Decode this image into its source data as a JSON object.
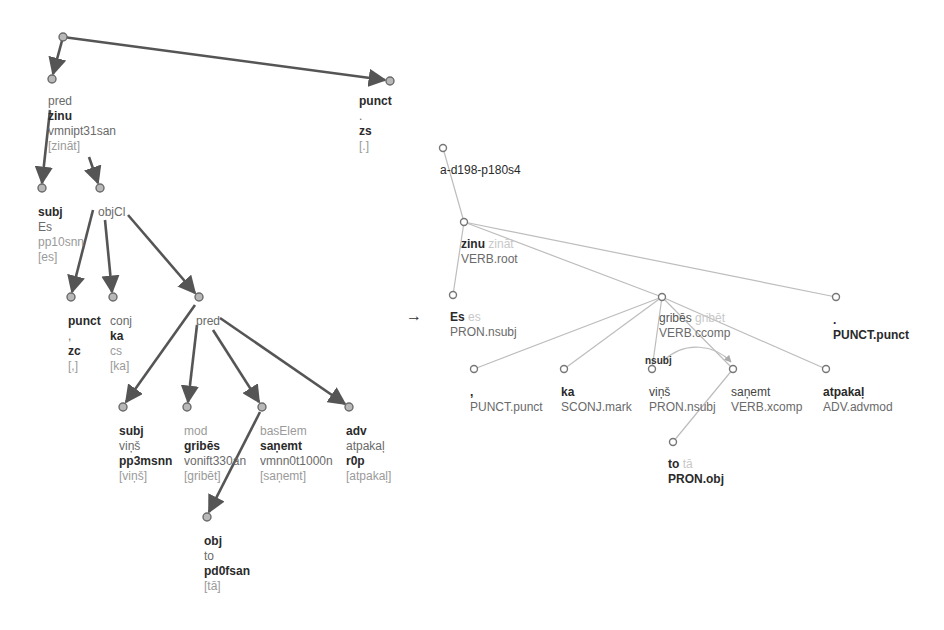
{
  "separator_arrow": "→",
  "left_tree": {
    "nodes": [
      {
        "id": "root",
        "x": 63,
        "y": 37
      },
      {
        "id": "pred",
        "x": 52,
        "y": 79,
        "rel": "pred",
        "form": "zinu",
        "tag": "vmnipt31san",
        "lemma": "[zināt]"
      },
      {
        "id": "punct_top",
        "x": 390,
        "y": 81,
        "rel": "punct",
        "form": ".",
        "tag": "zs",
        "lemma": "[.]"
      },
      {
        "id": "subj_es",
        "x": 42,
        "y": 188,
        "rel": "subj",
        "form": "Es",
        "tag": "pp10snn",
        "lemma": "[es]"
      },
      {
        "id": "objcl",
        "x": 100,
        "y": 188,
        "rel": "objCl"
      },
      {
        "id": "punct_comma",
        "x": 71,
        "y": 297,
        "rel": "punct",
        "form": ",",
        "tag": "zc",
        "lemma": "[,]"
      },
      {
        "id": "conj_ka",
        "x": 113,
        "y": 297,
        "rel": "conj",
        "form": "ka",
        "tag": "cs",
        "lemma": "[ka]"
      },
      {
        "id": "pred2",
        "x": 199,
        "y": 297,
        "rel": "pred"
      },
      {
        "id": "subj_vins",
        "x": 123,
        "y": 407,
        "rel": "subj",
        "form": "viņš",
        "tag": "pp3msnn",
        "lemma": "[viņš]"
      },
      {
        "id": "mod_gribes",
        "x": 187,
        "y": 407,
        "rel": "mod",
        "form": "gribēs",
        "tag": "vonift330an",
        "lemma": "[gribēt]"
      },
      {
        "id": "baselem",
        "x": 262,
        "y": 407,
        "rel": "basElem",
        "form": "saņemt",
        "tag": "vmnn0t1000n",
        "lemma": "[saņemt]"
      },
      {
        "id": "adv",
        "x": 349,
        "y": 407,
        "rel": "adv",
        "form": "atpakaļ",
        "tag": "r0p",
        "lemma": "[atpakaļ]"
      },
      {
        "id": "obj_to",
        "x": 207,
        "y": 517,
        "rel": "obj",
        "form": "to",
        "tag": "pd0fsan",
        "lemma": "[tā]"
      }
    ]
  },
  "right_tree": {
    "sentence_id": "a-d198-p180s4",
    "nodes": [
      {
        "id": "r_root",
        "x": 443,
        "y": 148
      },
      {
        "id": "r_zinu",
        "x": 464,
        "y": 222,
        "form": "zinu",
        "lemma": "zināt",
        "pos_rel": "VERB.root"
      },
      {
        "id": "r_es",
        "x": 453,
        "y": 295,
        "form": "Es",
        "lemma": "es",
        "pos_rel": "PRON.nsubj"
      },
      {
        "id": "r_gribes",
        "x": 662,
        "y": 297,
        "form": "gribēs",
        "lemma": "gribēt",
        "pos_rel": "VERB.ccomp"
      },
      {
        "id": "r_punct",
        "x": 836,
        "y": 297,
        "form": ".",
        "lemma": "",
        "pos_rel": "PUNCT.punct"
      },
      {
        "id": "r_comma",
        "x": 474,
        "y": 369,
        "form": ",",
        "lemma": "",
        "pos_rel": "PUNCT.punct"
      },
      {
        "id": "r_ka",
        "x": 564,
        "y": 369,
        "form": "ka",
        "lemma": "",
        "pos_rel": "SCONJ.mark"
      },
      {
        "id": "r_vins",
        "x": 652,
        "y": 369,
        "form": "viņš",
        "lemma": "",
        "pos_rel": "PRON.nsubj"
      },
      {
        "id": "r_sanemt",
        "x": 733,
        "y": 369,
        "form": "saņemt",
        "lemma": "",
        "pos_rel": "VERB.xcomp"
      },
      {
        "id": "r_atpakal",
        "x": 826,
        "y": 369,
        "form": "atpakaļ",
        "lemma": "",
        "pos_rel": "ADV.advmod"
      },
      {
        "id": "r_to",
        "x": 673,
        "y": 442,
        "form": "to",
        "lemma": "tā",
        "pos_rel": "PRON.obj"
      }
    ],
    "enhanced_edge_label": "nsubj"
  }
}
